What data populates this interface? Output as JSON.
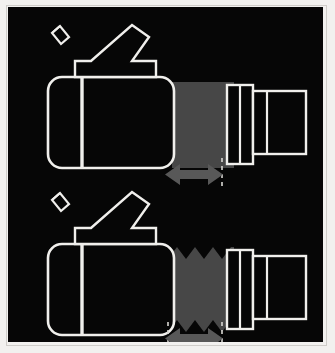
{
  "figure": {
    "background_color": "#060606",
    "outline_color": "#f0efec",
    "bellows_color": "#474747",
    "arrow_color": "#585858",
    "border_color": "#f2f1ef",
    "panel_count": 2
  },
  "panels": [
    {
      "id": "panel-top",
      "label": "retracted",
      "body": {
        "name": "camera-body",
        "x": 40,
        "y": 70,
        "width": 125,
        "height": 90,
        "corner_radius": 14,
        "divider_x": 73
      },
      "viewfinder": {
        "name": "viewfinder-arm",
        "eyepiece_angle_deg": -37
      },
      "bellows": {
        "name": "bellows-smooth",
        "x": 165,
        "y": 75,
        "width": 60,
        "height": 85,
        "style": "smooth",
        "fill": "#474747"
      },
      "lens_sections": [
        {
          "name": "lens-barrel-inner",
          "x": 219,
          "y": 78,
          "width": 24,
          "height": 78,
          "divider_x": 231
        },
        {
          "name": "lens-barrel-outer",
          "x": 245,
          "y": 84,
          "width": 52,
          "height": 62,
          "divider_x": 258
        }
      ],
      "arrow": {
        "name": "travel-arrow",
        "x": 158,
        "y": 158,
        "width": 57,
        "height": 19,
        "heads": "double",
        "fill": "#585858"
      },
      "dashed_guides": [
        {
          "name": "guide-right",
          "x": 215,
          "y_top": 152,
          "y_bottom": 181
        }
      ]
    },
    {
      "id": "panel-bottom",
      "label": "extended",
      "body": {
        "name": "camera-body",
        "x": 40,
        "y": 237,
        "width": 125,
        "height": 90,
        "corner_radius": 14,
        "divider_x": 73
      },
      "viewfinder": {
        "name": "viewfinder-arm",
        "eyepiece_angle_deg": -37
      },
      "bellows": {
        "name": "bellows-pleated",
        "x": 160,
        "y": 240,
        "width": 66,
        "height": 85,
        "style": "zigzag",
        "teeth": 7,
        "tooth_depth": 12,
        "fill": "#474747"
      },
      "lens_sections": [
        {
          "name": "lens-barrel-inner",
          "x": 219,
          "y": 243,
          "width": 24,
          "height": 78,
          "divider_x": 231
        },
        {
          "name": "lens-barrel-outer",
          "x": 245,
          "y": 249,
          "width": 52,
          "height": 62,
          "divider_x": 258
        }
      ],
      "arrow": {
        "name": "travel-arrow",
        "x": 158,
        "y": 322,
        "width": 57,
        "height": 19,
        "heads": "double",
        "fill": "#585858"
      },
      "dashed_guides": [
        {
          "name": "guide-left",
          "x": 160,
          "y_top": 316,
          "y_bottom": 345
        },
        {
          "name": "guide-right",
          "x": 215,
          "y_top": 316,
          "y_bottom": 345
        }
      ]
    }
  ]
}
